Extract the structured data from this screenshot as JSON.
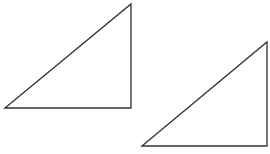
{
  "diagram": {
    "stroke_color": "#333333",
    "background": "#ffffff",
    "shapes": [
      {
        "name": "triangle-1",
        "type": "right-triangle",
        "points": "5,108 131,4 131,108"
      },
      {
        "name": "triangle-2",
        "type": "right-triangle",
        "points": "142,146 267,42 267,146"
      }
    ]
  }
}
